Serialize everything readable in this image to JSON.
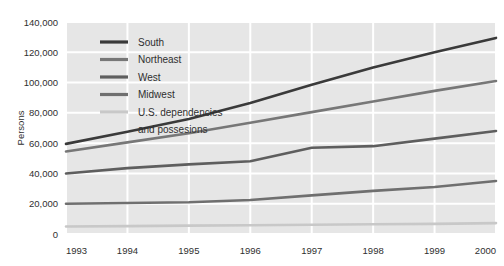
{
  "chart_data": {
    "type": "line",
    "title": "",
    "subtitle": "",
    "xlabel": "",
    "ylabel": "Persons",
    "x": [
      1993,
      1994,
      1995,
      1996,
      1997,
      1998,
      1999,
      2000
    ],
    "xticklabels": [
      "1993",
      "1994",
      "1995",
      "1996",
      "1997",
      "1998",
      "1999",
      "2000"
    ],
    "xlim": [
      1993,
      2000
    ],
    "ylim": [
      0,
      140000
    ],
    "yticks": [
      0,
      20000,
      40000,
      60000,
      80000,
      100000,
      120000,
      140000
    ],
    "yticklabels": [
      "0",
      "20,000",
      "40,000",
      "60,000",
      "80,000",
      "100,000",
      "120,000",
      "140,000"
    ],
    "grid": true,
    "grid_color": "#ffffff",
    "plot_background": "#e6e6e6",
    "legend_position": "upper-left",
    "series": [
      {
        "name": "South",
        "color": "#3a3a3a",
        "values": [
          59500,
          67500,
          76000,
          86500,
          98500,
          110000,
          120000,
          129500
        ]
      },
      {
        "name": "Northeast",
        "color": "#777777",
        "values": [
          54500,
          60500,
          66500,
          73500,
          80500,
          87500,
          94500,
          101000
        ]
      },
      {
        "name": "West",
        "color": "#5e5e5e",
        "values": [
          40000,
          43500,
          46000,
          48000,
          57000,
          58000,
          63000,
          68000
        ]
      },
      {
        "name": "Midwest",
        "color": "#6f6f6f",
        "values": [
          20000,
          20500,
          21000,
          22500,
          25500,
          28500,
          31000,
          35000
        ]
      },
      {
        "name": "U.S. dependencies and possesions",
        "color": "#c8c8c8",
        "values": [
          5000,
          5200,
          5500,
          5800,
          6100,
          6400,
          6700,
          7200
        ]
      }
    ]
  },
  "legend": {
    "entries": [
      {
        "label": "South"
      },
      {
        "label": "Northeast"
      },
      {
        "label": "West"
      },
      {
        "label": "Midwest"
      },
      {
        "label": "U.S. dependencies"
      },
      {
        "label": "and possesions"
      }
    ]
  }
}
